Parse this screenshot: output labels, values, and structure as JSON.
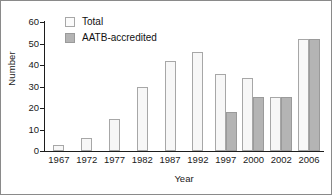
{
  "chart_data": {
    "type": "bar",
    "title": "",
    "xlabel": "Year",
    "ylabel": "Number",
    "categories": [
      "1967",
      "1972",
      "1977",
      "1982",
      "1987",
      "1992",
      "1997",
      "2000",
      "2002",
      "2006"
    ],
    "series": [
      {
        "name": "Total",
        "color": "#f7f7f7",
        "values": [
          3,
          6,
          15,
          30,
          42,
          46,
          36,
          34,
          25,
          52
        ]
      },
      {
        "name": "AATB-accredited",
        "color": "#b4b4b4",
        "values": [
          0,
          0,
          0,
          0,
          0,
          0,
          18,
          25,
          25,
          52
        ]
      }
    ],
    "ylim": [
      0,
      60
    ],
    "yticks": [
      0,
      10,
      20,
      30,
      40,
      50,
      60
    ],
    "ytick_labels": [
      "0",
      "10",
      "20",
      "30",
      "40",
      "50",
      "60"
    ],
    "grid": false,
    "legend_position": "top-left"
  },
  "legend": {
    "items": [
      {
        "label": "Total",
        "swatch": "total"
      },
      {
        "label": "AATB-accredited",
        "swatch": "aatb"
      }
    ]
  },
  "axes": {
    "y_title": "Number",
    "x_title": "Year"
  }
}
